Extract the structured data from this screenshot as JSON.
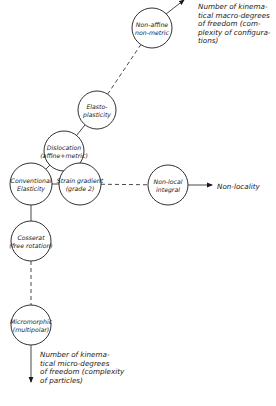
{
  "diagram": {
    "nodes": [
      {
        "id": "non_affine",
        "lines": [
          "Non-affine",
          "non-metric"
        ],
        "cx": 152,
        "cy": 28,
        "r": 20
      },
      {
        "id": "elasto_plasticity",
        "lines": [
          "Elasto-",
          "plasticity"
        ],
        "cx": 97,
        "cy": 110,
        "r": 19
      },
      {
        "id": "dislocation",
        "lines": [
          "Dislocation",
          "(affine+metric)"
        ],
        "cx": 64,
        "cy": 151,
        "r": 20
      },
      {
        "id": "conventional_elasticity",
        "lines": [
          "Conventional",
          "Elasticity"
        ],
        "cx": 31,
        "cy": 184,
        "r": 21
      },
      {
        "id": "strain_gradient",
        "lines": [
          "Strain gradient",
          "(grade 2)"
        ],
        "cx": 80,
        "cy": 184,
        "r": 21
      },
      {
        "id": "non_local_integral",
        "lines": [
          "Non-local",
          "integral"
        ],
        "cx": 168,
        "cy": 185,
        "r": 20
      },
      {
        "id": "cosserat",
        "lines": [
          "Cosserat",
          "(free rotation)"
        ],
        "cx": 31,
        "cy": 241,
        "r": 20
      },
      {
        "id": "micromorphic",
        "lines": [
          "Micromorphic",
          "(multipolar)"
        ],
        "cx": 31,
        "cy": 325,
        "r": 20
      }
    ],
    "edges": [
      {
        "from": "elasto_plasticity",
        "to": "non_affine",
        "style": "dashed"
      },
      {
        "from": "dislocation",
        "to": "elasto_plasticity",
        "style": "solid"
      },
      {
        "from": "conventional_elasticity",
        "to": "dislocation",
        "style": "solid"
      },
      {
        "from": "conventional_elasticity",
        "to": "strain_gradient",
        "style": "solid"
      },
      {
        "from": "strain_gradient",
        "to": "non_local_integral",
        "style": "dashed"
      },
      {
        "from": "conventional_elasticity",
        "to": "cosserat",
        "style": "solid"
      },
      {
        "from": "cosserat",
        "to": "micromorphic",
        "style": "dashed"
      }
    ],
    "axis_arrows": [
      {
        "id": "macro",
        "from": [
          166,
          14
        ],
        "to": [
          184,
          0
        ],
        "label_lines": [
          "Number of kinema-",
          "tical macro-degrees",
          "of freedom (com-",
          "plexity of configura-",
          "tions)"
        ],
        "label_x": 198,
        "label_y": 9
      },
      {
        "id": "nonlocality",
        "from": [
          188,
          185
        ],
        "to": [
          212,
          185
        ],
        "label_lines": [
          "Non-locality"
        ],
        "label_x": 217,
        "label_y": 189
      },
      {
        "id": "micro",
        "from": [
          31,
          345
        ],
        "to": [
          31,
          382
        ],
        "label_lines": [
          "Number of kinema-",
          "tical micro-degrees",
          "of freedom (complexity",
          "of particles)"
        ],
        "label_x": 40,
        "label_y": 357
      }
    ]
  }
}
